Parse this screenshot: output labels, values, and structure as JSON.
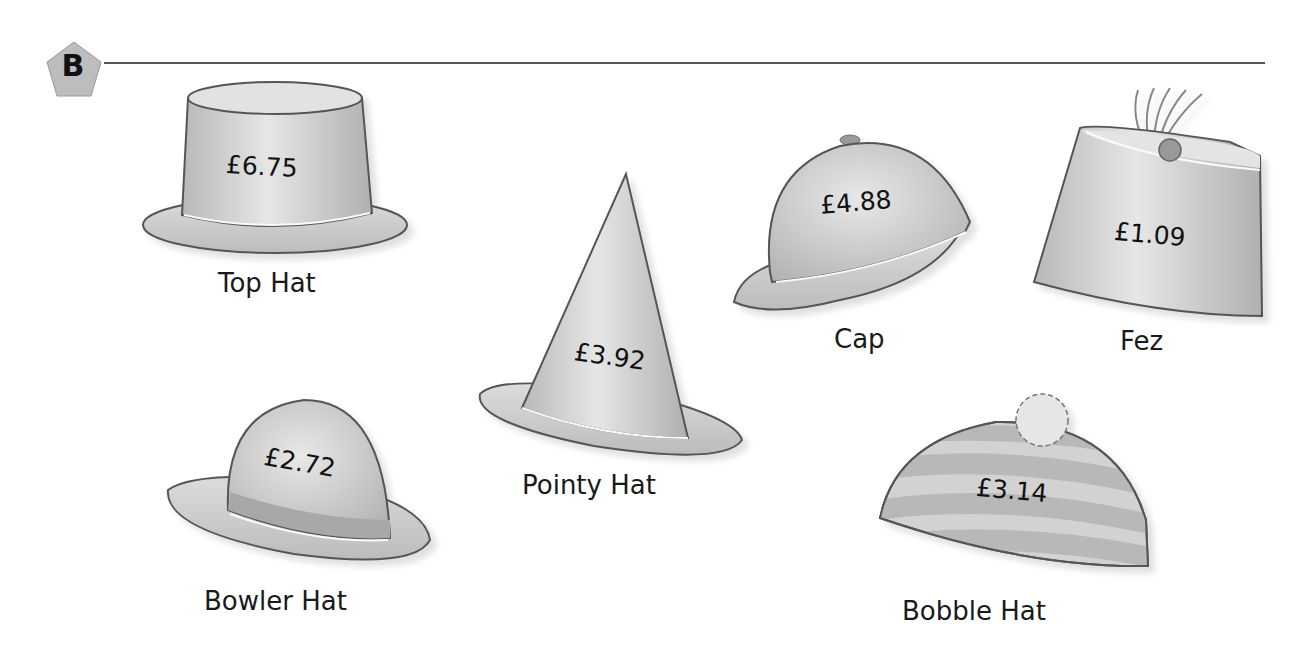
{
  "section": {
    "letter": "B"
  },
  "hats": [
    {
      "name": "Top Hat",
      "price": "£6.75"
    },
    {
      "name": "Pointy Hat",
      "price": "£3.92"
    },
    {
      "name": "Cap",
      "price": "£4.88"
    },
    {
      "name": "Fez",
      "price": "£1.09"
    },
    {
      "name": "Bowler Hat",
      "price": "£2.72"
    },
    {
      "name": "Bobble Hat",
      "price": "£3.14"
    }
  ],
  "colors": {
    "hat_fill": "#c8c8c8",
    "hat_outline": "#555555",
    "badge_fill": "#bdbdbd",
    "rule": "#555555"
  }
}
